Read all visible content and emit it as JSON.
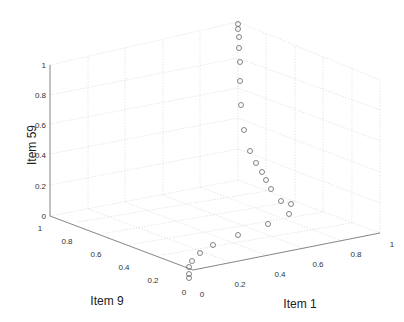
{
  "chart_data": {
    "type": "scatter3d",
    "title": "",
    "xlabel": "Item 1",
    "ylabel": "Item 9",
    "zlabel": "Item 59",
    "xlim": [
      0,
      1
    ],
    "ylim": [
      0,
      1
    ],
    "zlim": [
      0,
      1
    ],
    "grid": true,
    "marker": "open-circle",
    "x_ticks": [
      "0",
      "0.2",
      "0.4",
      "0.6",
      "0.8",
      "1"
    ],
    "y_ticks": [
      "0",
      "0.2",
      "0.4",
      "0.6",
      "0.8",
      "1"
    ],
    "z_ticks": [
      "0",
      "0.2",
      "0.4",
      "0.6",
      "0.8",
      "1"
    ],
    "pixel_points": [
      [
        238,
        24
      ],
      [
        238,
        29
      ],
      [
        239,
        37
      ],
      [
        239,
        48
      ],
      [
        240,
        62
      ],
      [
        240,
        81
      ],
      [
        241,
        105
      ],
      [
        244,
        130
      ],
      [
        250,
        151
      ],
      [
        256,
        163
      ],
      [
        262,
        172
      ],
      [
        266,
        180
      ],
      [
        271,
        189
      ],
      [
        281,
        201
      ],
      [
        291,
        204
      ],
      [
        289,
        214
      ],
      [
        268,
        224
      ],
      [
        238,
        235
      ],
      [
        213,
        245
      ],
      [
        200,
        253
      ],
      [
        192,
        261
      ],
      [
        189,
        267
      ],
      [
        189,
        274
      ],
      [
        189,
        278
      ]
    ],
    "colors": {
      "marker": "#666666",
      "axis": "#555555",
      "grid": "#d8d8d8"
    }
  }
}
